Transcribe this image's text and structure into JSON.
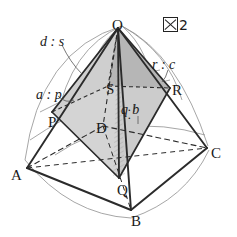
{
  "figure": {
    "number_label": "2",
    "caption_icon": "figure-box-icon"
  },
  "solid": {
    "type": "square-pyramid-with-inscribed-pyramid",
    "outer_apex": "O",
    "base_vertices": [
      "A",
      "B",
      "C",
      "D"
    ],
    "inner_vertices": [
      "P",
      "Q",
      "R",
      "S"
    ],
    "shaded_solid": "O-PQRS"
  },
  "vertices": [
    {
      "name": "O",
      "label": "O",
      "x": 112,
      "y": 18
    },
    {
      "name": "A",
      "label": "A",
      "x": 11,
      "y": 168
    },
    {
      "name": "B",
      "label": "B",
      "x": 131,
      "y": 214
    },
    {
      "name": "C",
      "label": "C",
      "x": 211,
      "y": 146
    },
    {
      "name": "D",
      "label": "D",
      "x": 96,
      "y": 121
    },
    {
      "name": "P",
      "label": "P",
      "x": 48,
      "y": 115
    },
    {
      "name": "Q",
      "label": "Q",
      "x": 117,
      "y": 183
    },
    {
      "name": "R",
      "label": "R",
      "x": 172,
      "y": 83
    },
    {
      "name": "S",
      "label": "S",
      "x": 106,
      "y": 82
    }
  ],
  "ratios": [
    {
      "name": "ratio-d-s",
      "numerator": "d",
      "denominator": "s",
      "text": "d : s",
      "x": 40,
      "y": 35
    },
    {
      "name": "ratio-a-p",
      "numerator": "a",
      "denominator": "p",
      "text": "a : p",
      "x": 36,
      "y": 88
    },
    {
      "name": "ratio-r-c",
      "numerator": "r",
      "denominator": "c",
      "text": "r : c",
      "x": 152,
      "y": 58
    },
    {
      "name": "ratio-q-b",
      "numerator": "q",
      "denominator": "b",
      "text": "q : b",
      "x": 122,
      "y": 95
    }
  ],
  "colors": {
    "stroke": "#2b2b2b",
    "shade_light": "#d6d6d6",
    "shade_mid": "#c2c2c2",
    "shade_dark": "#b0b0b0",
    "background": "#ffffff",
    "guide": "#8a8a8a"
  }
}
